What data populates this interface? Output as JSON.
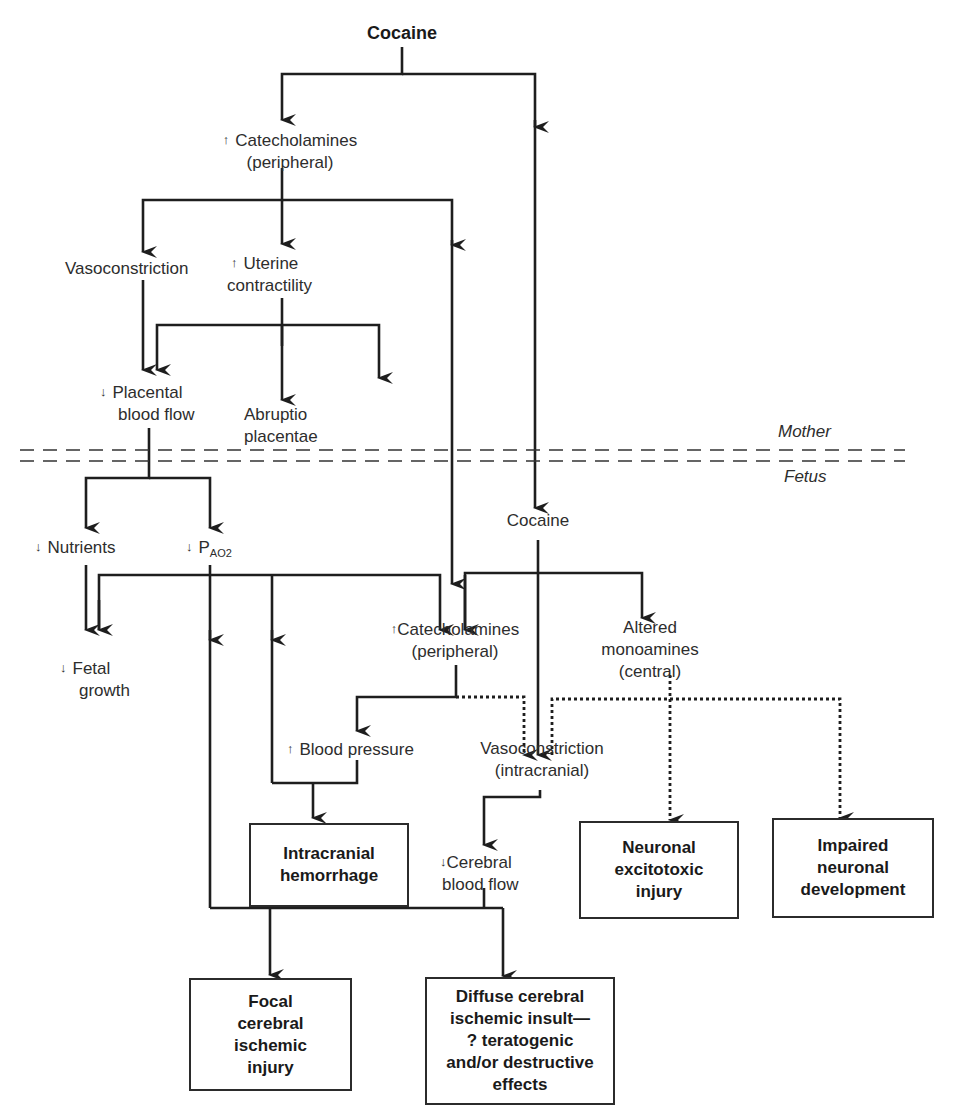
{
  "diagram": {
    "title": "Cocaine",
    "boundary": {
      "upper_label": "Mother",
      "lower_label": "Fetus"
    },
    "maternal_nodes": {
      "catecholamines": {
        "arrow": "↑",
        "line1": "Catecholamines",
        "line2": "(peripheral)"
      },
      "vasoconstriction": {
        "label": "Vasoconstriction"
      },
      "uterine": {
        "arrow": "↑",
        "line1": "Uterine",
        "line2": "contractility"
      },
      "placental": {
        "arrow": "↓",
        "line1": "Placental",
        "line2": "blood flow"
      },
      "abruptio": {
        "line1": "Abruptio",
        "line2": "placentae"
      }
    },
    "fetal_nodes": {
      "cocaine": {
        "label": "Cocaine"
      },
      "nutrients": {
        "arrow": "↓",
        "label": "Nutrients"
      },
      "pao2": {
        "arrow": "↓",
        "label": "P",
        "sub": "AO2"
      },
      "fetal_growth": {
        "arrow": "↓",
        "line1": "Fetal",
        "line2": "growth"
      },
      "catecholamines": {
        "arrow": "↑",
        "line1": "Catecholamines",
        "line2": "(peripheral)"
      },
      "monoamines": {
        "line1": "Altered",
        "line2": "monoamines",
        "line3": "(central)"
      },
      "blood_pressure": {
        "arrow": "↑",
        "label": "Blood pressure"
      },
      "vasoconstriction": {
        "line1": "Vasoconstriction",
        "line2": "(intracranial)"
      },
      "cerebral_flow": {
        "arrow": "↓",
        "line1": "Cerebral",
        "line2": "blood flow"
      }
    },
    "outcomes": {
      "hemorrhage": "Intracranial\nhemorrhage",
      "excitotoxic": "Neuronal\nexcitotoxic\ninjury",
      "development": "Impaired\nneuronal\ndevelopment",
      "focal": "Focal\ncerebral\nischemic\ninjury",
      "diffuse": "Diffuse cerebral\nischemic insult—\n? teratogenic\nand/or destructive\neffects"
    },
    "colors": {
      "line": "#1e1e1e",
      "text": "#2d2d2d",
      "background": "#ffffff"
    }
  }
}
